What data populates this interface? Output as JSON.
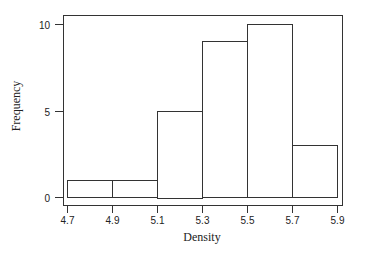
{
  "chart_data": {
    "type": "bar",
    "subtype": "histogram",
    "title": "",
    "xlabel": "Density",
    "ylabel": "Frequency",
    "bin_edges": [
      4.7,
      4.9,
      5.1,
      5.3,
      5.5,
      5.7,
      5.9
    ],
    "categories": [
      "4.7-4.9",
      "4.9-5.1",
      "5.1-5.3",
      "5.3-5.5",
      "5.5-5.7",
      "5.7-5.9"
    ],
    "values": [
      1,
      1,
      5,
      9,
      10,
      3
    ],
    "xticks": [
      "4.7",
      "4.9",
      "5.1",
      "5.3",
      "5.5",
      "5.7",
      "5.9"
    ],
    "yticks": [
      "0",
      "5",
      "10"
    ],
    "xlim": [
      4.7,
      5.9
    ],
    "ylim": [
      0,
      10
    ],
    "grid": false,
    "legend": null,
    "colors": {
      "bar_fill": "#ffffff",
      "bar_edge": "#333333",
      "frame": "#333333"
    }
  }
}
